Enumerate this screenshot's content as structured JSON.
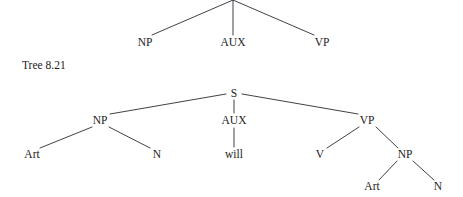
{
  "page": {
    "background": "#ffffff",
    "ink_color": "#1c1c22",
    "line_color": "#2b2b33",
    "width": 463,
    "height": 197
  },
  "caption": {
    "text": "Tree 8.21",
    "x": 22,
    "y": 69
  },
  "trees": [
    {
      "id": "tree-upper",
      "name": "upper-phrase-structure-tree",
      "note": "cropped at top edge; root node not visible",
      "root": {
        "x": 233,
        "y": 0,
        "label": "",
        "visible": false
      },
      "nodes": [
        {
          "id": "u-np",
          "label": "NP",
          "x": 145,
          "y": 46,
          "name": "node-np"
        },
        {
          "id": "u-aux",
          "label": "AUX",
          "x": 233,
          "y": 46,
          "name": "node-aux"
        },
        {
          "id": "u-vp",
          "label": "VP",
          "x": 322,
          "y": 46,
          "name": "node-vp"
        }
      ],
      "edges": [
        {
          "x1": 233,
          "y1": 0,
          "x2": 152,
          "y2": 35,
          "name": "edge-root-np"
        },
        {
          "x1": 233,
          "y1": 0,
          "x2": 233,
          "y2": 35,
          "name": "edge-root-aux"
        },
        {
          "x1": 233,
          "y1": 0,
          "x2": 314,
          "y2": 35,
          "name": "edge-root-vp"
        }
      ]
    },
    {
      "id": "tree-lower",
      "name": "lower-phrase-structure-tree",
      "root": {
        "x": 234,
        "y": 97,
        "label": "S",
        "visible": true
      },
      "nodes": [
        {
          "id": "l-s",
          "label": "S",
          "x": 234,
          "y": 97,
          "name": "node-s"
        },
        {
          "id": "l-np",
          "label": "NP",
          "x": 100,
          "y": 124,
          "name": "node-np-subject"
        },
        {
          "id": "l-aux",
          "label": "AUX",
          "x": 234,
          "y": 124,
          "name": "node-aux"
        },
        {
          "id": "l-vp",
          "label": "VP",
          "x": 367,
          "y": 124,
          "name": "node-vp"
        },
        {
          "id": "l-art1",
          "label": "Art",
          "x": 32,
          "y": 158,
          "name": "node-art-subject"
        },
        {
          "id": "l-n1",
          "label": "N",
          "x": 157,
          "y": 158,
          "name": "node-n-subject"
        },
        {
          "id": "l-will",
          "label": "will",
          "x": 234,
          "y": 158,
          "name": "node-will"
        },
        {
          "id": "l-v",
          "label": "V",
          "x": 320,
          "y": 158,
          "name": "node-v"
        },
        {
          "id": "l-np2",
          "label": "NP",
          "x": 405,
          "y": 158,
          "name": "node-np-object"
        },
        {
          "id": "l-art2",
          "label": "Art",
          "x": 372,
          "y": 190,
          "name": "node-art-object"
        },
        {
          "id": "l-n2",
          "label": "N",
          "x": 438,
          "y": 190,
          "name": "node-n-object"
        }
      ],
      "edges": [
        {
          "x1": 226,
          "y1": 94,
          "x2": 110,
          "y2": 114,
          "name": "edge-s-np"
        },
        {
          "x1": 234,
          "y1": 100,
          "x2": 234,
          "y2": 113,
          "name": "edge-s-aux"
        },
        {
          "x1": 242,
          "y1": 94,
          "x2": 358,
          "y2": 114,
          "name": "edge-s-vp"
        },
        {
          "x1": 92,
          "y1": 127,
          "x2": 40,
          "y2": 148,
          "name": "edge-np-art"
        },
        {
          "x1": 109,
          "y1": 127,
          "x2": 150,
          "y2": 148,
          "name": "edge-np-n"
        },
        {
          "x1": 234,
          "y1": 128,
          "x2": 234,
          "y2": 147,
          "name": "edge-aux-will"
        },
        {
          "x1": 359,
          "y1": 127,
          "x2": 327,
          "y2": 148,
          "name": "edge-vp-v"
        },
        {
          "x1": 376,
          "y1": 127,
          "x2": 398,
          "y2": 148,
          "name": "edge-vp-np"
        },
        {
          "x1": 397,
          "y1": 161,
          "x2": 379,
          "y2": 180,
          "name": "edge-np-art-object"
        },
        {
          "x1": 413,
          "y1": 161,
          "x2": 434,
          "y2": 180,
          "name": "edge-np-n-object"
        }
      ]
    }
  ]
}
